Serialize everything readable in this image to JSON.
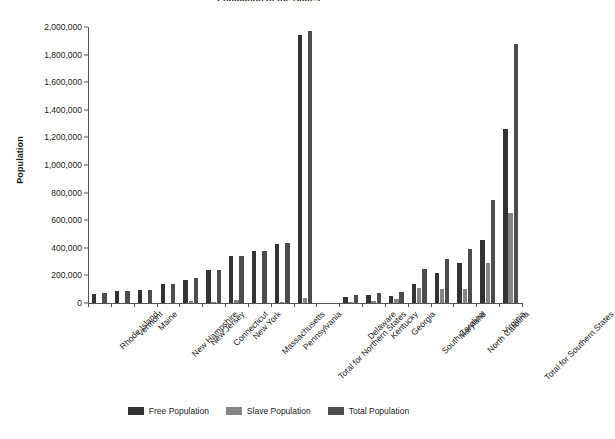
{
  "chart_data": {
    "type": "bar",
    "title": "Population of the States",
    "xlabel": "",
    "ylabel": "Population",
    "ylim": [
      0,
      2000000
    ],
    "ytick_step": 200000,
    "ytick_labels": [
      "0",
      "200,000",
      "400,000",
      "600,000",
      "800,000",
      "1,000,000",
      "1,200,000",
      "1,400,000",
      "1,600,000",
      "1,800,000",
      "2,000,000"
    ],
    "grid": false,
    "legend_position": "bottom",
    "categories": [
      "Rhode Island",
      "Vermont",
      "Maine",
      "New Hampshire",
      "New Jersey",
      "Connecticut",
      "New York",
      "Massachusetts",
      "Pennsylvania",
      "Total for Northern States",
      "",
      "Delaware",
      "Kentucky",
      "Georgia",
      "South Carolina",
      "Maryland",
      "North Carolina",
      "Virginia",
      "Total for Southern States"
    ],
    "series": [
      {
        "name": "Free Population",
        "color": "#333333",
        "values": [
          68000,
          85000,
          96000,
          141000,
          169000,
          237000,
          340000,
          378000,
          430000,
          1944000,
          null,
          46000,
          61000,
          53000,
          141000,
          216000,
          288000,
          455000,
          1260000
        ]
      },
      {
        "name": "Slave Population",
        "color": "#868686",
        "values": [
          0,
          0,
          0,
          0,
          11000,
          2700,
          21000,
          0,
          3700,
          38000,
          null,
          8900,
          12000,
          29000,
          107000,
          103000,
          101000,
          293000,
          654000
        ]
      },
      {
        "name": "Total Population",
        "color": "#4d4d4d",
        "values": [
          69000,
          85000,
          96000,
          141000,
          184000,
          238000,
          340000,
          379000,
          434000,
          1968000,
          null,
          59000,
          74000,
          82000,
          249000,
          320000,
          394000,
          748000,
          1875000
        ]
      }
    ]
  },
  "legend": {
    "items": [
      {
        "label": "Free Population",
        "swatch": "free"
      },
      {
        "label": "Slave Population",
        "swatch": "slave"
      },
      {
        "label": "Total Population",
        "swatch": "total"
      }
    ]
  }
}
